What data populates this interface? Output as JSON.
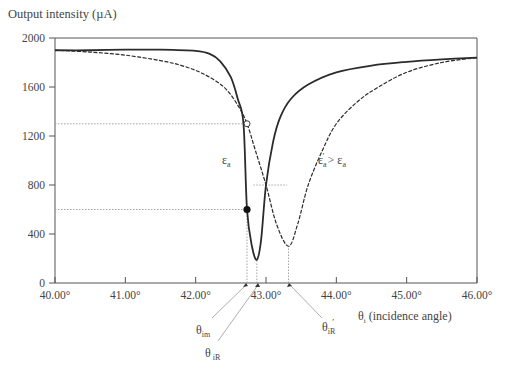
{
  "chart_data": {
    "type": "line",
    "title": "",
    "xlabel": "θi (incidence angle)",
    "ylabel": "Output intensity (µA)",
    "xlim": [
      40.0,
      46.0
    ],
    "ylim": [
      0,
      2000
    ],
    "x_ticks": [
      "40.00°",
      "41.00°",
      "42.00°",
      "43.00°",
      "44.00°",
      "45.00°",
      "46.00°"
    ],
    "x_tick_values": [
      40,
      41,
      42,
      43,
      44,
      45,
      46
    ],
    "y_ticks": [
      "0",
      "400",
      "800",
      "1200",
      "1600",
      "2000"
    ],
    "y_tick_values": [
      0,
      400,
      800,
      1200,
      1600,
      2000
    ],
    "grid": false,
    "series": [
      {
        "name": "εa",
        "style": "solid",
        "x": [
          40.0,
          40.5,
          41.0,
          41.5,
          42.0,
          42.2,
          42.35,
          42.5,
          42.6,
          42.68,
          42.73,
          42.8,
          42.87,
          42.93,
          43.0,
          43.1,
          43.2,
          43.35,
          43.6,
          44.0,
          44.5,
          45.0,
          45.5,
          46.0
        ],
        "y": [
          1900,
          1900,
          1905,
          1905,
          1895,
          1870,
          1810,
          1680,
          1500,
          1300,
          600,
          300,
          190,
          350,
          800,
          1150,
          1350,
          1500,
          1620,
          1720,
          1775,
          1805,
          1825,
          1840
        ]
      },
      {
        "name": "ε'a > εa",
        "style": "dashed",
        "x": [
          40.0,
          40.5,
          41.0,
          41.5,
          41.8,
          42.1,
          42.4,
          42.6,
          42.73,
          42.85,
          43.0,
          43.15,
          43.32,
          43.45,
          43.6,
          43.8,
          44.0,
          44.3,
          44.6,
          45.0,
          45.5,
          46.0
        ],
        "y": [
          1900,
          1885,
          1860,
          1815,
          1775,
          1710,
          1600,
          1450,
          1300,
          1080,
          800,
          480,
          300,
          480,
          800,
          1080,
          1300,
          1480,
          1600,
          1720,
          1800,
          1840
        ]
      }
    ],
    "markers": [
      {
        "type": "open-circle",
        "x": 42.73,
        "y": 1300
      },
      {
        "type": "filled-circle",
        "x": 42.73,
        "y": 600
      }
    ],
    "reference_lines": [
      {
        "orientation": "horizontal",
        "y": 1300,
        "from_x": 40.0,
        "to_x": 42.73,
        "style": "dotted"
      },
      {
        "orientation": "horizontal",
        "y": 600,
        "from_x": 40.0,
        "to_x": 42.73,
        "style": "dotted"
      },
      {
        "orientation": "horizontal",
        "y": 800,
        "from_x": 42.82,
        "to_x": 43.3,
        "style": "dotted"
      },
      {
        "orientation": "vertical",
        "x": 42.73,
        "from_y": 0,
        "to_y": 600,
        "style": "dotted"
      },
      {
        "orientation": "vertical",
        "x": 42.87,
        "from_y": 0,
        "to_y": 190,
        "style": "dotted"
      },
      {
        "orientation": "vertical",
        "x": 43.32,
        "from_y": 0,
        "to_y": 300,
        "style": "dotted"
      }
    ],
    "annotations": [
      {
        "text": "εa",
        "x": 42.3,
        "y": 1030
      },
      {
        "text": "ε'a > εa",
        "x": 43.7,
        "y": 1030
      },
      {
        "text": "θim",
        "points_to_x": 42.73
      },
      {
        "text": "θiR",
        "points_to_x": 42.87
      },
      {
        "text": "θ'iR",
        "points_to_x": 43.32
      }
    ]
  },
  "labels": {
    "y_axis_title": "Output intensity (µA)",
    "x_axis_title_symbol": "θ",
    "x_axis_title_sub": "i",
    "x_axis_title_rest": " (incidence angle)",
    "curve_a": "ε",
    "curve_a_sub": "a",
    "curve_b_main": "ε",
    "curve_b_sub": "a",
    "curve_b_prime": "′",
    "curve_b_rest": " > ε",
    "curve_b_rest_sub": "a",
    "theta_im": "θ",
    "theta_im_sub": "im",
    "theta_iR": "θ",
    "theta_iR_sub": "iR",
    "theta_iR_prime": "θ",
    "theta_iR_prime_sub": "iR",
    "theta_iR_prime_mark": "′"
  },
  "colors": {
    "curve": "#2b2b2b",
    "axis": "#555555",
    "dotted": "#9a9a9a",
    "text": "#444444"
  }
}
